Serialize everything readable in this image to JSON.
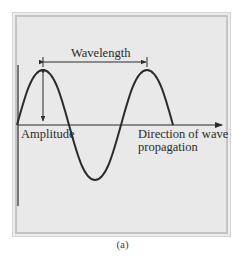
{
  "figure": {
    "labels": {
      "wavelength": "Wavelength",
      "amplitude": "Amplitude",
      "direction_line1": "Direction of wave",
      "direction_line2": "propagation"
    },
    "caption": "(a)",
    "colors": {
      "wave": "#2b2b2b",
      "background": "#e9e9e9",
      "frame": "#c4c4c4"
    }
  }
}
